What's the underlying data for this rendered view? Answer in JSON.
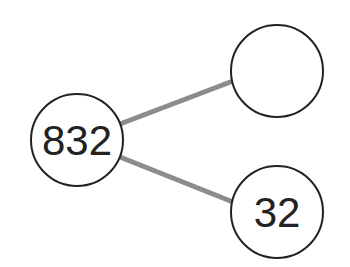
{
  "diagram": {
    "type": "number-bond",
    "colors": {
      "background": "#ffffff",
      "node_stroke": "#222222",
      "edge": "#8c8c8c",
      "text": "#222222"
    },
    "nodes": [
      {
        "id": "whole",
        "label": "832",
        "cx": 77,
        "cy": 140,
        "r": 46
      },
      {
        "id": "part-top",
        "label": "",
        "cx": 277,
        "cy": 71,
        "r": 46
      },
      {
        "id": "part-bottom",
        "label": "32",
        "cx": 277,
        "cy": 212,
        "r": 46
      }
    ],
    "edges": [
      {
        "from": "whole",
        "to": "part-top"
      },
      {
        "from": "whole",
        "to": "part-bottom"
      }
    ]
  }
}
